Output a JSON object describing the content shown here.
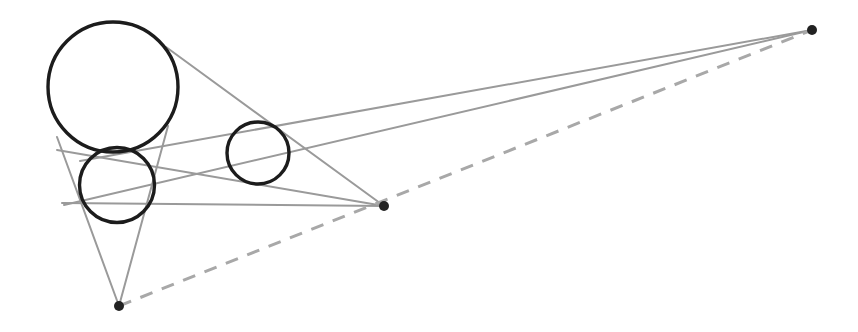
{
  "canvas": {
    "width": 858,
    "height": 332,
    "background": "#ffffff",
    "title": "Monge's three-circle theorem construction"
  },
  "style": {
    "circle_stroke": "#1c1c1c",
    "circle_stroke_width": 3.4,
    "circle_fill": "none",
    "tangent_stroke": "#9a9a9a",
    "tangent_stroke_width": 2.0,
    "monge_line_stroke": "#a8a8a8",
    "monge_line_stroke_width": 3.0,
    "monge_line_dash": "13 10",
    "point_fill": "#222222",
    "point_radius": 5
  },
  "chart_data": {
    "type": "diagram",
    "circles": [
      {
        "name": "large-circle",
        "cx": 113,
        "cy": 87,
        "r": 65
      },
      {
        "name": "small-circle",
        "cx": 117,
        "cy": 185,
        "r": 37.5
      },
      {
        "name": "middle-circle",
        "cx": 258,
        "cy": 153,
        "r": 31
      }
    ],
    "points": [
      {
        "name": "homothety-center-bottom",
        "x": 119,
        "y": 306
      },
      {
        "name": "homothety-center-middle",
        "x": 384,
        "y": 206
      },
      {
        "name": "homothety-center-right",
        "x": 812,
        "y": 30
      }
    ],
    "tangent_lines": [
      {
        "name": "tangent-bottom-left-a",
        "x1": 57,
        "y1": 137,
        "x2": 119,
        "y2": 306
      },
      {
        "name": "tangent-bottom-left-b",
        "x1": 168,
        "y1": 126,
        "x2": 119,
        "y2": 306
      },
      {
        "name": "tangent-middle-upper",
        "x1": 166,
        "y1": 47,
        "x2": 384,
        "y2": 206
      },
      {
        "name": "tangent-middle-lower",
        "x1": 57,
        "y1": 150,
        "x2": 384,
        "y2": 206
      },
      {
        "name": "tangent-middle-third",
        "x1": 62,
        "y1": 203,
        "x2": 384,
        "y2": 206
      },
      {
        "name": "tangent-right-upper",
        "x1": 80,
        "y1": 161,
        "x2": 812,
        "y2": 30
      },
      {
        "name": "tangent-right-lower",
        "x1": 64,
        "y1": 205,
        "x2": 812,
        "y2": 30
      }
    ],
    "monge_line": {
      "name": "monge-line",
      "x1": 119,
      "y1": 306,
      "x2": 812,
      "y2": 30,
      "dashed": true
    }
  }
}
